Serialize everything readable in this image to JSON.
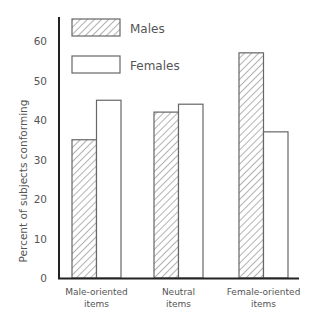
{
  "chart_data": {
    "type": "bar",
    "title": "",
    "xlabel": "",
    "ylabel": "Percent of subjects conforming",
    "ylim": [
      0,
      65
    ],
    "yticks": [
      0,
      10,
      20,
      30,
      40,
      50,
      60
    ],
    "grid": false,
    "legend_position": "top-left (inside plot)",
    "categories": [
      [
        "Male-oriented",
        "items"
      ],
      [
        "Neutral",
        "items"
      ],
      [
        "Female-oriented",
        "items"
      ]
    ],
    "series": [
      {
        "name": "Males",
        "pattern": "diagonal-hatch",
        "values": [
          35,
          42,
          57
        ]
      },
      {
        "name": "Females",
        "pattern": "solid-white",
        "values": [
          45,
          44,
          37
        ]
      }
    ]
  },
  "colors": {
    "axis": "#222222",
    "bar_outline": "#666666",
    "hatch": "#555555",
    "text": "#555555",
    "background": "#ffffff"
  }
}
